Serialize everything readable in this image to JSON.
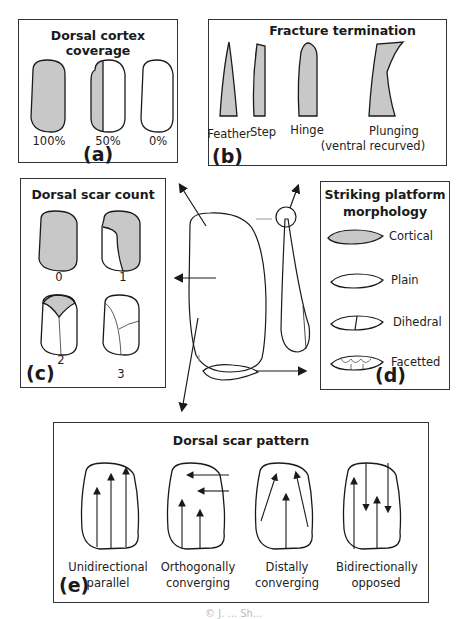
{
  "panels": {
    "a": {
      "title": "Dorsal cortex coverage",
      "letter": "(a)",
      "items": [
        {
          "label": "100%"
        },
        {
          "label": "50%"
        },
        {
          "label": "0%"
        }
      ]
    },
    "b": {
      "title": "Fracture termination",
      "letter": "(b)",
      "items": [
        {
          "label": "Feather"
        },
        {
          "label": "Step"
        },
        {
          "label": "Hinge"
        },
        {
          "label": "Plunging",
          "sublabel": "(ventral recurved)"
        }
      ]
    },
    "c": {
      "title": "Dorsal scar count",
      "letter": "(c)",
      "items": [
        {
          "label": "0"
        },
        {
          "label": "1"
        },
        {
          "label": "2"
        },
        {
          "label": "3"
        }
      ]
    },
    "d": {
      "title_line1": "Striking platform",
      "title_line2": "morphology",
      "letter": "(d)",
      "items": [
        {
          "label": "Cortical"
        },
        {
          "label": "Plain"
        },
        {
          "label": "Dihedral"
        },
        {
          "label": "Facetted"
        }
      ]
    },
    "e": {
      "title": "Dorsal scar pattern",
      "letter": "(e)",
      "items": [
        {
          "line1": "Unidirectional",
          "line2": "parallel"
        },
        {
          "line1": "Orthogonally",
          "line2": "converging"
        },
        {
          "line1": "Distally",
          "line2": "converging"
        },
        {
          "line1": "Bidirectionally",
          "line2": "opposed"
        }
      ]
    }
  },
  "colors": {
    "cortex_fill": "#c8c8c8",
    "stroke": "#1a1a1a",
    "border": "#333333"
  },
  "watermark": "© J. ... Sh..."
}
